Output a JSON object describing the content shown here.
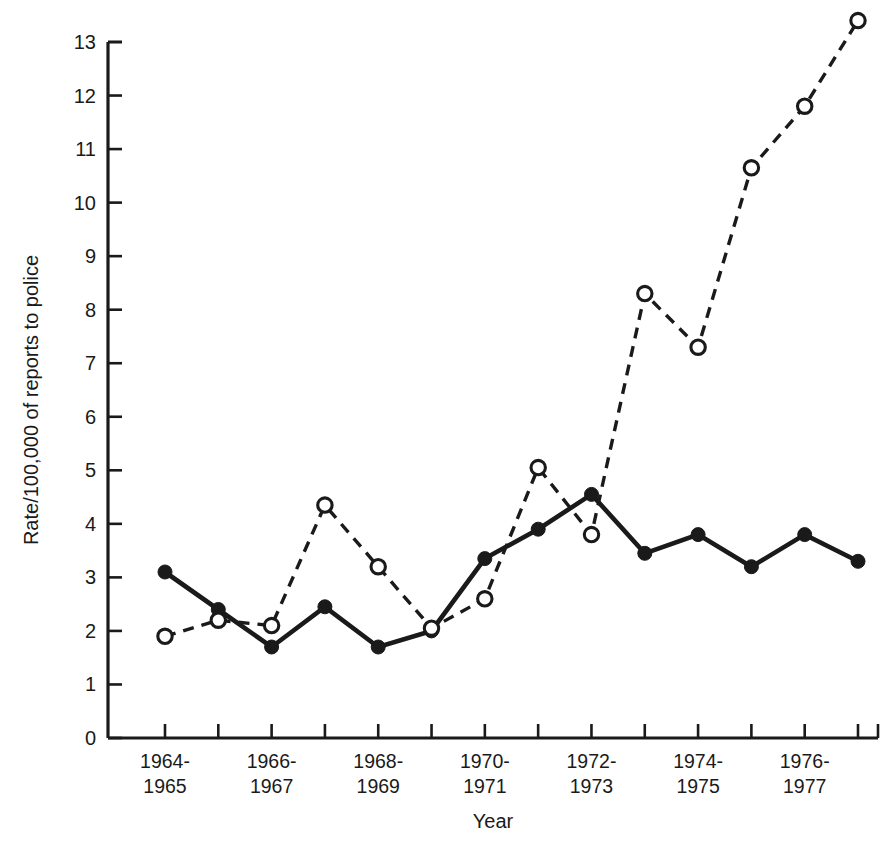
{
  "chart_data": {
    "type": "line",
    "title": "",
    "xlabel": "Year",
    "ylabel": "Rate/100,000 of reports to police",
    "ylim": [
      0,
      13
    ],
    "ytick_values": [
      0,
      1,
      2,
      3,
      4,
      5,
      6,
      7,
      8,
      9,
      10,
      11,
      12,
      13
    ],
    "ytick_labels": [
      "0",
      "1",
      "2",
      "3",
      "4",
      "5",
      "6",
      "7",
      "8",
      "9",
      "10",
      "11",
      "12",
      "13"
    ],
    "grid": false,
    "legend_position": "none",
    "x_index": [
      1,
      2,
      3,
      4,
      5,
      6,
      7,
      8,
      9,
      10,
      11,
      12,
      13,
      14
    ],
    "xtick_labels": [
      {
        "index": 1,
        "line1": "1964-",
        "line2": "1965"
      },
      {
        "index": 3,
        "line1": "1966-",
        "line2": "1967"
      },
      {
        "index": 5,
        "line1": "1968-",
        "line2": "1969"
      },
      {
        "index": 7,
        "line1": "1970-",
        "line2": "1971"
      },
      {
        "index": 9,
        "line1": "1972-",
        "line2": "1973"
      },
      {
        "index": 11,
        "line1": "1974-",
        "line2": "1975"
      },
      {
        "index": 13,
        "line1": "1976-",
        "line2": "1977"
      }
    ],
    "series": [
      {
        "name": "solid-filled-circles",
        "marker": "filled-circle",
        "linestyle": "solid",
        "color": "#1a1a1a",
        "values": [
          3.1,
          2.4,
          1.7,
          2.45,
          1.7,
          2.0,
          3.35,
          3.9,
          4.55,
          3.45,
          3.8,
          3.2,
          3.8,
          3.3
        ]
      },
      {
        "name": "dashed-open-circles",
        "marker": "open-circle",
        "linestyle": "dashed",
        "color": "#1a1a1a",
        "values": [
          1.9,
          2.2,
          2.1,
          4.35,
          3.2,
          2.05,
          2.6,
          5.05,
          3.8,
          8.3,
          7.3,
          10.65,
          11.8,
          13.4
        ]
      }
    ]
  },
  "axes": {
    "y_axis_title": "Rate/100,000 of reports to police",
    "x_axis_title": "Year"
  }
}
